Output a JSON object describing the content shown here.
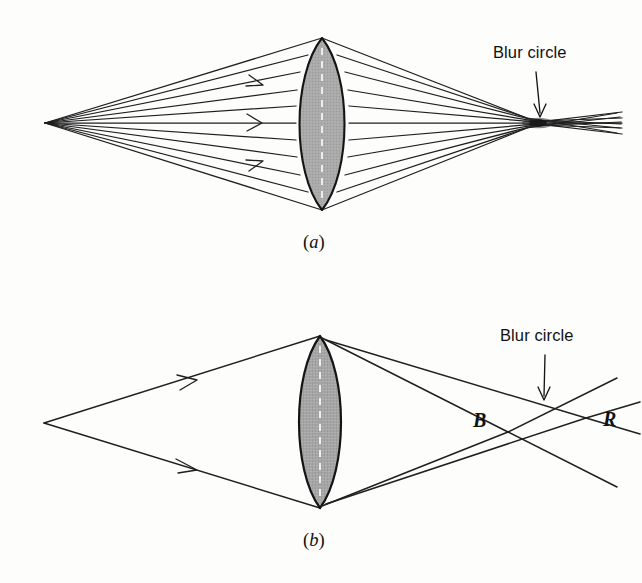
{
  "figure": {
    "type": "optics-ray-diagram",
    "background_color": "#fdfdfc",
    "ink_color": "#1a1a1a",
    "lens_fill_color": "#a8a8a8",
    "lens_axis_color": "#ffffff",
    "panels": [
      {
        "id": "a",
        "caption": "(a)",
        "caption_letter": "a",
        "description": "Spherical aberration: a cone of rays from an axial point source passes through a thick biconvex lens and does not converge to a single point, forming a blur circle.",
        "annotations": [
          {
            "name": "blur-circle",
            "text": "Blur circle"
          }
        ]
      },
      {
        "id": "b",
        "caption": "(b)",
        "caption_letter": "b",
        "description": "Chromatic aberration: blue and red rays focus at different points B and R, the smallest cross section between them is the blur circle.",
        "annotations": [
          {
            "name": "blur-circle",
            "text": "Blur circle"
          },
          {
            "name": "blue-focus",
            "text": "B"
          },
          {
            "name": "red-focus",
            "text": "R"
          }
        ]
      }
    ]
  },
  "labels": {
    "blur_circle_a": "Blur circle",
    "blur_circle_b": "Blur circle",
    "focus_blue": "B",
    "focus_red": "R",
    "caption_a": "(a)",
    "caption_b": "(b)",
    "caption_a_open": "(",
    "caption_a_letter": "a",
    "caption_a_close": ")",
    "caption_b_open": "(",
    "caption_b_letter": "b",
    "caption_b_close": ")"
  },
  "geometry": {
    "panel_a": {
      "source_point": [
        45,
        123
      ],
      "lens_top": [
        322,
        38
      ],
      "lens_bottom": [
        322,
        210
      ],
      "lens_half_width": 24,
      "focus_region": [
        537,
        123
      ],
      "ray_count": 11
    },
    "panel_b": {
      "source_point": [
        44,
        423
      ],
      "lens_top": [
        320,
        336
      ],
      "lens_bottom": [
        320,
        508
      ],
      "lens_half_width": 22,
      "blue_focus": [
        508,
        432
      ],
      "red_focus": [
        586,
        418
      ],
      "blur_circle_crossing": [
        543,
        404
      ]
    }
  }
}
